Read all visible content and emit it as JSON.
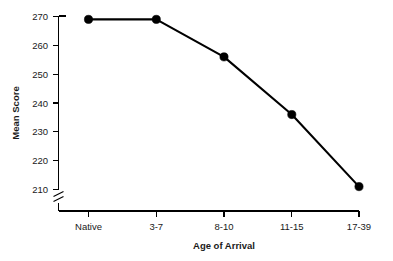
{
  "chart_data": {
    "type": "line",
    "title": "",
    "subtitle": "",
    "xlabel": "Age of Arrival",
    "ylabel": "Mean Score",
    "categories": [
      "Native",
      "3-7",
      "8-10",
      "11-15",
      "17-39"
    ],
    "values": [
      269,
      269,
      256,
      236,
      211
    ],
    "series": [
      {
        "name": "Mean Score",
        "values": [
          269,
          269,
          256,
          236,
          211
        ]
      }
    ],
    "ylim": [
      205,
      272
    ],
    "yticks": [
      210,
      220,
      230,
      240,
      250,
      260,
      270
    ],
    "ytick_labels": [
      "210",
      "220",
      "230",
      "240",
      "250",
      "260",
      "270"
    ],
    "xtick_labels": [
      "Native",
      "3-7",
      "8-10",
      "11-15",
      "17-39"
    ],
    "grid": false,
    "legend": false,
    "legend_position": "none",
    "axis_break": true,
    "axis_break_note": "y-axis broken below 210",
    "marker": "filled-circle",
    "line_color": "#000000",
    "marker_color": "#000000",
    "background_color": "#ffffff",
    "annotations": []
  },
  "axes": {
    "y_title": "Mean Score",
    "x_title": "Age of Arrival"
  }
}
